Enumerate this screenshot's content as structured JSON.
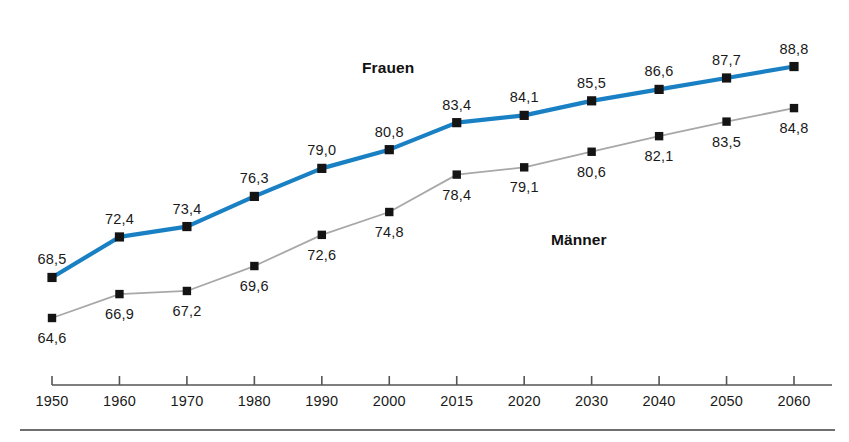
{
  "chart_data": {
    "type": "line",
    "title": "",
    "subtitle": "",
    "xlabel": "",
    "ylabel": "",
    "grid": false,
    "legend_position": "inline-annotation",
    "categories": [
      "1950",
      "1960",
      "1970",
      "1980",
      "1990",
      "2000",
      "2015",
      "2020",
      "2030",
      "2040",
      "2050",
      "2060"
    ],
    "ylim": [
      62,
      90
    ],
    "series": [
      {
        "name": "Frauen",
        "color": "#1a80c4",
        "values": [
          68.5,
          72.4,
          73.4,
          76.3,
          79.0,
          80.8,
          83.4,
          84.1,
          85.5,
          86.6,
          87.7,
          88.8
        ],
        "value_labels": [
          "68,5",
          "72,4",
          "73,4",
          "76,3",
          "79,0",
          "80,8",
          "83,4",
          "84,1",
          "85,5",
          "86,6",
          "87,7",
          "88,8"
        ],
        "label_side": [
          "above",
          "above",
          "above",
          "above",
          "above",
          "above",
          "above",
          "above",
          "above",
          "above",
          "above",
          "above"
        ]
      },
      {
        "name": "Männer",
        "color": "#a8a8a8",
        "values": [
          64.6,
          66.9,
          67.2,
          69.6,
          72.6,
          74.8,
          78.4,
          79.1,
          80.6,
          82.1,
          83.5,
          84.8
        ],
        "value_labels": [
          "64,6",
          "66,9",
          "67,2",
          "69,6",
          "72,6",
          "74,8",
          "78,4",
          "79,1",
          "80,6",
          "82,1",
          "83,5",
          "84,8"
        ],
        "label_side": [
          "below",
          "below",
          "below",
          "below",
          "below",
          "below",
          "below",
          "below",
          "below",
          "below",
          "below",
          "below"
        ]
      }
    ],
    "annotations": [
      {
        "text": "Frauen",
        "name": "series-annotation-frauen"
      },
      {
        "text": "Männer",
        "name": "series-annotation-maenner"
      }
    ],
    "axis": {
      "x_tick_labels": [
        "1950",
        "1960",
        "1970",
        "1980",
        "1990",
        "2000",
        "2015",
        "2020",
        "2030",
        "2040",
        "2050",
        "2060"
      ],
      "axis_color": "#555555",
      "marker_color": "#141414",
      "marker_shape": "square"
    }
  },
  "layout": {
    "plot_left": 52,
    "plot_right": 794,
    "axis_y": 385,
    "axis_end_x": 832,
    "y_top_value": 90.2,
    "y_bottom_value": 62.0,
    "y_top_px": 52,
    "y_bottom_px": 345
  }
}
